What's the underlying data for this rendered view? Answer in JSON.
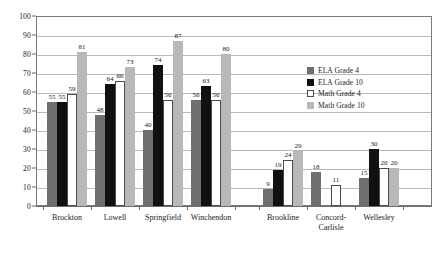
{
  "chart_data": {
    "type": "bar",
    "title": "",
    "subtitle": "",
    "xlabel": "",
    "ylabel": "",
    "ylim": [
      0,
      100
    ],
    "ytick_labels": [
      "0",
      "10",
      "20",
      "30",
      "40",
      "50",
      "60",
      "70",
      "80",
      "90",
      "100"
    ],
    "ytick_values": [
      0,
      10,
      20,
      30,
      40,
      50,
      60,
      70,
      80,
      90,
      100
    ],
    "grid": true,
    "legend_position": "inside-right",
    "categories": [
      "Brockton",
      "Lowell",
      "Springfield",
      "Winchendon",
      "Brookline",
      "Concord-Carlisle",
      "Wellesley"
    ],
    "series": [
      {
        "name": "ELA Grade 4",
        "color": "#6f6f6f",
        "values": [
          55,
          48,
          40,
          56,
          9,
          18,
          15
        ]
      },
      {
        "name": "ELA Grade 10",
        "color": "#111111",
        "values": [
          55,
          64,
          74,
          63,
          19,
          null,
          30
        ]
      },
      {
        "name": "Math Grade 4",
        "color": "#ffffff",
        "values": [
          59,
          66,
          56,
          56,
          24,
          11,
          20
        ]
      },
      {
        "name": "Math Grade 10",
        "color": "#b8b8b8",
        "values": [
          81,
          73,
          87,
          80,
          29,
          null,
          20
        ]
      }
    ],
    "data_labels": [
      [
        "55",
        "55",
        "59",
        "81"
      ],
      [
        "48",
        "64",
        "66",
        "73"
      ],
      [
        "40",
        "74",
        "56",
        "87"
      ],
      [
        "56",
        "63",
        "56",
        "80"
      ],
      [
        "9",
        "19",
        "24",
        "29"
      ],
      [
        "18",
        "",
        "11",
        ""
      ],
      [
        "15",
        "30",
        "20",
        "20"
      ]
    ]
  },
  "colors": {
    "series_0": "#6f6f6f",
    "series_1": "#111111",
    "series_2": "#ffffff",
    "series_3": "#b8b8b8",
    "axis": "#6e6e6e",
    "grid": "#b9b9b9",
    "text": "#1a1a1a",
    "background": "#ffffff"
  }
}
